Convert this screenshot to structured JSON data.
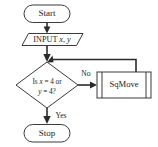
{
  "diagram": {
    "type": "flowchart",
    "background_color": "#ffffff",
    "shape_fill": "#ffffff",
    "shape_stroke": "#3a3a3a",
    "connector_color": "#2b2b2b",
    "text_color": "#1a1a1a"
  },
  "nodes": {
    "start": {
      "label": "Start",
      "shape": "terminator"
    },
    "input": {
      "label": "INPUT",
      "var1": "x",
      "comma": ",",
      "var2": "y",
      "shape": "parallelogram-io"
    },
    "decision": {
      "line1_pre": "Is ",
      "line1_var": "x",
      "line1_post": " = 4 or",
      "line2_var": "y",
      "line2_post": " = 4?",
      "shape": "diamond"
    },
    "sqmove": {
      "label": "SqMove",
      "shape": "predefined-process"
    },
    "stop": {
      "label": "Stop",
      "shape": "terminator"
    }
  },
  "edges": {
    "start_to_input": {
      "label": ""
    },
    "input_to_junction": {
      "label": ""
    },
    "decision_to_sqmove": {
      "label": "No"
    },
    "decision_to_stop": {
      "label": "Yes"
    },
    "sqmove_loop_back": {
      "label": ""
    }
  }
}
